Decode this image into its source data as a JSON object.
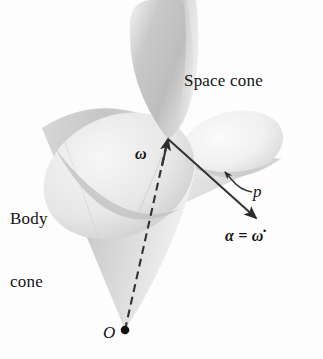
{
  "figure": {
    "background_color": "#fdfdfd",
    "ink_color": "#141414",
    "cone_fill_light": "#e9e9e9",
    "cone_fill_mid": "#cfcfcf",
    "cone_fill_dark": "#b4b4b4",
    "vector_color": "#333333",
    "width": 323,
    "height": 359
  },
  "labels": {
    "space_cone": "Space cone",
    "body_cone_line1": "Body",
    "body_cone_line2": "cone",
    "omega": "ω",
    "precession": "p",
    "alpha_equals_omega_dot": "α = ω̇",
    "origin": "O"
  },
  "vectors": [
    {
      "name": "omega",
      "label": "ω",
      "style": "dashed-with-arrowhead",
      "from": [
        125,
        330
      ],
      "to": [
        168,
        139
      ],
      "color": "#333333"
    },
    {
      "name": "alpha",
      "label": "α = ω̇",
      "style": "solid-with-arrowhead",
      "from": [
        168,
        139
      ],
      "to": [
        258,
        220
      ],
      "color": "#333333"
    },
    {
      "name": "precession-leader",
      "label": "p",
      "style": "curved-leader-with-arrowhead",
      "from": [
        251,
        194
      ],
      "to": [
        224,
        172
      ],
      "color": "#333333"
    }
  ],
  "points": [
    {
      "name": "apex",
      "label": "O",
      "position": [
        125,
        330
      ],
      "marker": "filled-dot"
    }
  ],
  "cones": [
    {
      "name": "body-cone",
      "label": "Body cone",
      "apex": [
        125,
        330
      ],
      "opening_direction": "upper-left"
    },
    {
      "name": "body-cone-upper-nappe",
      "label": "",
      "apex": [
        168,
        139
      ],
      "opening_direction": "up"
    },
    {
      "name": "space-cone",
      "label": "Space cone",
      "apex": [
        125,
        330
      ],
      "opening_direction": "upper-right"
    }
  ]
}
